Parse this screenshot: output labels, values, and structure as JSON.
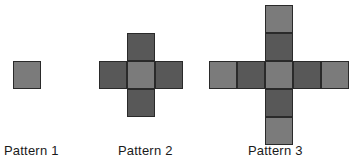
{
  "figure": {
    "type": "geometric-pattern-sequence",
    "background_color": "#ffffff",
    "stroke_color": "#2a2a2a",
    "cell_size": 28,
    "colors": {
      "light_gray": "#7b7b7b",
      "dark_gray": "#585858"
    },
    "patterns": [
      {
        "id": "pattern-1",
        "caption": "Pattern 1",
        "square_count": 1,
        "origin": {
          "x": 13,
          "y": 61
        },
        "caption_position": {
          "x": 4,
          "y": 143
        },
        "cells": [
          {
            "col": 0,
            "row": 0,
            "shade": "light_gray"
          }
        ]
      },
      {
        "id": "pattern-2",
        "caption": "Pattern 2",
        "square_count": 5,
        "origin": {
          "x": 99,
          "y": 33
        },
        "caption_position": {
          "x": 118,
          "y": 143
        },
        "cells": [
          {
            "col": 1,
            "row": 0,
            "shade": "dark_gray"
          },
          {
            "col": 0,
            "row": 1,
            "shade": "dark_gray"
          },
          {
            "col": 1,
            "row": 1,
            "shade": "light_gray"
          },
          {
            "col": 2,
            "row": 1,
            "shade": "dark_gray"
          },
          {
            "col": 1,
            "row": 2,
            "shade": "dark_gray"
          }
        ]
      },
      {
        "id": "pattern-3",
        "caption": "Pattern 3",
        "square_count": 9,
        "origin": {
          "x": 209,
          "y": 5
        },
        "caption_position": {
          "x": 248,
          "y": 143
        },
        "cells": [
          {
            "col": 2,
            "row": 0,
            "shade": "light_gray"
          },
          {
            "col": 2,
            "row": 1,
            "shade": "dark_gray"
          },
          {
            "col": 0,
            "row": 2,
            "shade": "light_gray"
          },
          {
            "col": 1,
            "row": 2,
            "shade": "dark_gray"
          },
          {
            "col": 2,
            "row": 2,
            "shade": "light_gray"
          },
          {
            "col": 3,
            "row": 2,
            "shade": "dark_gray"
          },
          {
            "col": 4,
            "row": 2,
            "shade": "light_gray"
          },
          {
            "col": 2,
            "row": 3,
            "shade": "dark_gray"
          },
          {
            "col": 2,
            "row": 4,
            "shade": "light_gray"
          }
        ]
      }
    ]
  }
}
